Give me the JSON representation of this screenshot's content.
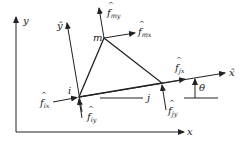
{
  "diagram": {
    "colors": {
      "line": "#222222",
      "background": "#ffffff"
    },
    "global_axes": {
      "x_label": "x",
      "y_label": "y"
    },
    "local_axes": {
      "x_label": "x̂",
      "y_label": "ŷ"
    },
    "nodes": [
      {
        "id": "i",
        "label": "i"
      },
      {
        "id": "j",
        "label": "j"
      },
      {
        "id": "m",
        "label": "m"
      }
    ],
    "forces": {
      "f_ix": {
        "base": "f",
        "sub": "ix"
      },
      "f_iy": {
        "base": "f",
        "sub": "iy"
      },
      "f_jx": {
        "base": "f",
        "sub": "jx"
      },
      "f_jy": {
        "base": "f",
        "sub": "jy"
      },
      "f_mx": {
        "base": "f",
        "sub": "mx"
      },
      "f_my": {
        "base": "f",
        "sub": "my"
      }
    },
    "angle": {
      "label": "θ"
    }
  }
}
